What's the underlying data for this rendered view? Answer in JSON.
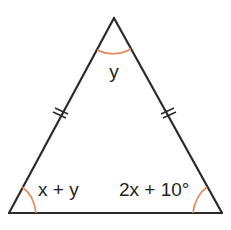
{
  "diagram": {
    "type": "isosceles-triangle",
    "vertices": {
      "apex": {
        "x": 114,
        "y": 18
      },
      "bottom_left": {
        "x": 9,
        "y": 213
      },
      "bottom_right": {
        "x": 222,
        "y": 213
      }
    },
    "angles": {
      "apex": {
        "label": "y"
      },
      "bottom_left": {
        "label": "x + y"
      },
      "bottom_right": {
        "label": "2x + 10°"
      }
    },
    "congruent_sides": [
      "left-side",
      "right-side"
    ],
    "tick_marks_per_side": 2,
    "colors": {
      "line": "#2b2b2b",
      "angle_arc": "#e8875a",
      "text": "#231f20"
    }
  }
}
